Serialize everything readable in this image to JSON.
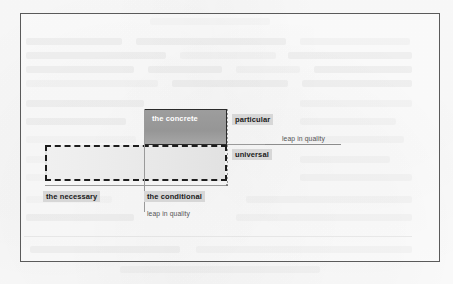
{
  "figure": {
    "boxes": {
      "concrete_label": "the concrete"
    },
    "captions": {
      "particular": "particular",
      "universal": "universal",
      "necessary": "the necessary",
      "conditional": "the conditional"
    },
    "annotations": {
      "leap_right": "leap in quality",
      "leap_bottom": "leap in quality"
    },
    "colors": {
      "frame_border": "#5a5a5a",
      "concrete_fill": "#9a9a9a",
      "concrete_border": "#2b2b2b",
      "necessary_fill": "#eaeaea",
      "necessary_border": "#1d1d1d",
      "caption_highlight": "#d7d7d7",
      "rule": "#9a9a9a",
      "page_background": "#fbfbfb"
    }
  }
}
